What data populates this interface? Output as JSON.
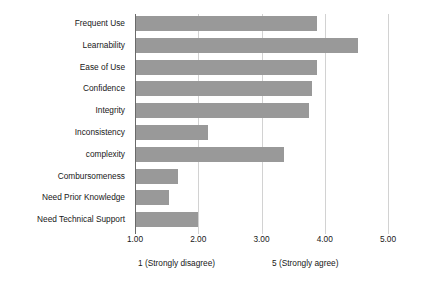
{
  "chart_data": {
    "type": "bar",
    "orientation": "horizontal",
    "title": "",
    "xlabel": "",
    "ylabel": "",
    "categories": [
      "Frequent Use",
      "Learnability",
      "Ease of Use",
      "Confidence",
      "Integrity",
      "Inconsistency",
      "complexity",
      "Combursomeness",
      "Need Prior Knowledge",
      "Need Technical Support"
    ],
    "values": [
      3.88,
      4.53,
      3.88,
      3.8,
      3.75,
      2.15,
      3.35,
      1.68,
      1.53,
      2.0
    ],
    "xlim": [
      1.0,
      5.0
    ],
    "xticks": [
      1.0,
      2.0,
      3.0,
      4.0,
      5.0
    ],
    "xtick_labels": [
      "1.00",
      "2.00",
      "3.00",
      "4.00",
      "5.00"
    ],
    "grid": true,
    "grid_axis": "x",
    "legend": false,
    "bar_color": "#999999",
    "grid_color": "#d2d2d2",
    "axis_color": "#6a6a6a",
    "annotations": [
      "1  (Strongly disagree)",
      "5  (Strongly agree)"
    ]
  },
  "captions": {
    "low": "1  (Strongly disagree)",
    "high": "5  (Strongly agree)"
  }
}
